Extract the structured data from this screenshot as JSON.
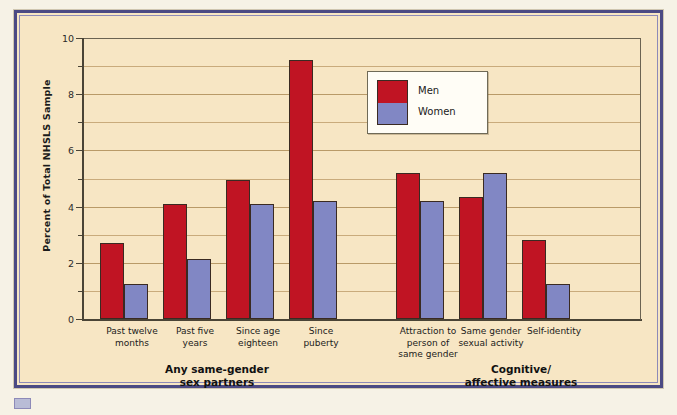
{
  "figure": {
    "background_color": "#f7e6c4",
    "frame_color": "#4b4a84"
  },
  "legend": {
    "position": "inside-top-center-right",
    "entries": [
      {
        "label": "Men",
        "color": "#c01423"
      },
      {
        "label": "Women",
        "color": "#8187c4"
      }
    ]
  },
  "chart_data": {
    "type": "bar",
    "title": "",
    "xlabel": "",
    "ylabel": "Percent of Total NHSLS Sample",
    "ylim": [
      0,
      10
    ],
    "yticks": [
      0,
      2,
      4,
      6,
      8,
      10
    ],
    "ytick_labels": [
      "0",
      "2",
      "4",
      "6",
      "8",
      "10"
    ],
    "minor_yticks": [
      1,
      3,
      5,
      7,
      9
    ],
    "grid": true,
    "legend_position": "inside upper center-right",
    "categories": [
      "Past twelve\nmonths",
      "Past five\nyears",
      "Since age\neighteen",
      "Since\npuberty",
      "Attraction to\nperson of\nsame gender",
      "Same gender\nsexual activity",
      "Self-identity"
    ],
    "groups": [
      {
        "title": "Any same-gender\nsex partners",
        "categories": [
          "Past twelve\nmonths",
          "Past five\nyears",
          "Since age\neighteen",
          "Since\npuberty"
        ]
      },
      {
        "title": "Cognitive/\naffective measures",
        "categories": [
          "Attraction to\nperson of\nsame gender",
          "Same gender\nsexual activity",
          "Self-identity"
        ]
      }
    ],
    "series": [
      {
        "name": "Men",
        "color": "#c01423",
        "values": [
          2.7,
          4.1,
          4.95,
          9.2,
          5.2,
          4.35,
          2.8
        ]
      },
      {
        "name": "Women",
        "color": "#8187c4",
        "values": [
          1.25,
          2.15,
          4.1,
          4.2,
          4.2,
          5.2,
          1.25
        ]
      }
    ]
  }
}
